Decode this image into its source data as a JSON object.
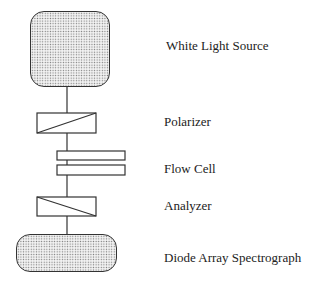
{
  "diagram": {
    "components": [
      {
        "id": "white-light-source",
        "label": "White Light Source",
        "shape": "rounded-rect-stippled"
      },
      {
        "id": "polarizer",
        "label": "Polarizer",
        "shape": "rect-diagonal-up"
      },
      {
        "id": "flow-cell",
        "label": "Flow Cell",
        "shape": "double-plate"
      },
      {
        "id": "analyzer",
        "label": "Analyzer",
        "shape": "rect-diagonal-down"
      },
      {
        "id": "diode-array-spectrograph",
        "label": "Diode Array Spectrograph",
        "shape": "rounded-rect-stippled"
      }
    ],
    "connections": [
      [
        "white-light-source",
        "polarizer"
      ],
      [
        "polarizer",
        "flow-cell"
      ],
      [
        "flow-cell",
        "analyzer"
      ],
      [
        "analyzer",
        "diode-array-spectrograph"
      ]
    ],
    "colors": {
      "stroke": "#333333",
      "text": "#222222",
      "background": "#ffffff"
    }
  }
}
